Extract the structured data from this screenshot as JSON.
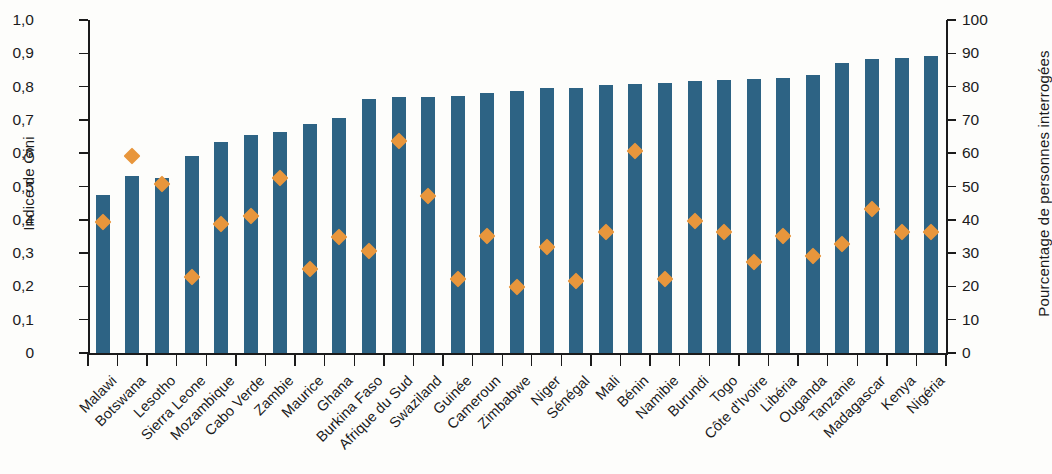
{
  "chart_data": {
    "type": "bar",
    "title": "",
    "subtitle": "",
    "ylabel": "Indice de Gini",
    "ylabel_right": "Pourcentage de personnes interrogées",
    "xlabel": "",
    "ylim": [
      0,
      1.0
    ],
    "ylim_right": [
      0,
      100
    ],
    "grid": false,
    "legend": [],
    "ytick_labels": [
      "1,0",
      "0,9",
      "0,8",
      "0,7",
      "0,6",
      "0,5",
      "0,4",
      "0,3",
      "0,2",
      "0,1",
      "0"
    ],
    "ytick_values": [
      1.0,
      0.9,
      0.8,
      0.7,
      0.6,
      0.5,
      0.4,
      0.3,
      0.2,
      0.1,
      0
    ],
    "ytick_labels_right": [
      "100",
      "90",
      "80",
      "70",
      "60",
      "50",
      "40",
      "30",
      "20",
      "10",
      "0"
    ],
    "ytick_values_right": [
      100,
      90,
      80,
      70,
      60,
      50,
      40,
      30,
      20,
      10,
      0
    ],
    "categories": [
      "Malawi",
      "Botswana",
      "Lesotho",
      "Sierra Leone",
      "Mozambique",
      "Cabo Verde",
      "Zambie",
      "Maurice",
      "Ghana",
      "Burkina Faso",
      "Afrique du Sud",
      "Swaziland",
      "Guinée",
      "Cameroun",
      "Zimbabwe",
      "Niger",
      "Sénégal",
      "Mali",
      "Bénin",
      "Namibie",
      "Burundi",
      "Togo",
      "Côte d'Ivoire",
      "Libéria",
      "Ouganda",
      "Tanzanie",
      "Madagascar",
      "Kenya",
      "Nigéria"
    ],
    "series": [
      {
        "name": "Indice de Gini",
        "type": "bar",
        "axis": "left",
        "color": "#2d6384",
        "values": [
          0.475,
          0.533,
          0.525,
          0.593,
          0.635,
          0.655,
          0.665,
          0.688,
          0.705,
          0.762,
          0.768,
          0.77,
          0.772,
          0.78,
          0.787,
          0.795,
          0.797,
          0.805,
          0.808,
          0.812,
          0.818,
          0.82,
          0.822,
          0.826,
          0.835,
          0.87,
          0.882,
          0.885,
          0.893
        ]
      },
      {
        "name": "Pourcentage de personnes interrogées",
        "type": "scatter",
        "axis": "right",
        "color": "#e8963c",
        "marker": "diamond",
        "values": [
          41,
          61,
          52.5,
          24.5,
          40.5,
          43,
          54.5,
          27,
          36.5,
          32.5,
          65.5,
          49,
          24,
          37,
          21.5,
          33.5,
          23.5,
          38,
          62.5,
          24,
          41.5,
          38,
          29,
          37,
          31,
          34.5,
          45,
          38,
          38
        ]
      }
    ]
  }
}
